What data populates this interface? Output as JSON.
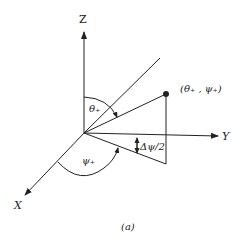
{
  "figure": {
    "caption": "(a)",
    "axes": {
      "z_label": "Z",
      "y_label": "Y",
      "x_label": "X"
    },
    "angles": {
      "theta_label": "θ₊",
      "psi_label": "ψ₊",
      "delta_psi_label": "Δψ/2"
    },
    "point_label": "(θ₊ , ψ₊)",
    "colors": {
      "stroke": "#222222",
      "background": "#ffffff"
    }
  }
}
